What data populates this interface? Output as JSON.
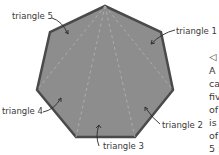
{
  "diagram": {
    "shape": "heptagon",
    "fill_color": "#8d8d8d",
    "outline_color": "#4a4a4a",
    "labels": [
      {
        "id": "triangle-1",
        "text": "triangle 1"
      },
      {
        "id": "triangle-2",
        "text": "triangle 2"
      },
      {
        "id": "triangle-3",
        "text": "triangle 3"
      },
      {
        "id": "triangle-4",
        "text": "triangle 4"
      },
      {
        "id": "triangle-5",
        "text": "triangle 5"
      }
    ]
  },
  "side_text": {
    "marker": "◁",
    "lines": [
      "A",
      "ca",
      "fiv",
      "of",
      "is",
      "of",
      "5 :"
    ]
  }
}
